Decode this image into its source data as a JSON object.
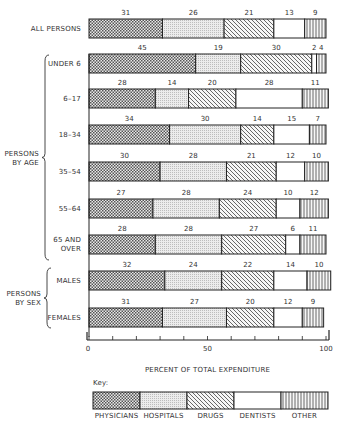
{
  "chart_data": {
    "type": "bar",
    "orientation": "horizontal",
    "stacked": true,
    "title": "",
    "xlabel": "PERCENT OF TOTAL EXPENDITURE",
    "ylabel": "",
    "xlim": [
      0,
      100
    ],
    "x_ticks": [
      0,
      10,
      20,
      30,
      40,
      50,
      60,
      70,
      80,
      90,
      100
    ],
    "x_tick_labels": [
      "0",
      "50",
      "100"
    ],
    "series_names": [
      "PHYSICIANS",
      "HOSPITALS",
      "DRUGS",
      "DENTISTS",
      "OTHER"
    ],
    "patterns": [
      "crosshatch",
      "stipple",
      "diagonal",
      "blank",
      "vertical"
    ],
    "rows": [
      {
        "label": "ALL PERSONS",
        "group": "",
        "values": [
          31,
          26,
          21,
          13,
          9
        ]
      },
      {
        "label": "UNDER 6",
        "group": "PERSONS BY AGE",
        "values": [
          45,
          19,
          30,
          2,
          4
        ]
      },
      {
        "label": "6–17",
        "group": "PERSONS BY AGE",
        "values": [
          28,
          14,
          20,
          28,
          11
        ]
      },
      {
        "label": "18–34",
        "group": "PERSONS BY AGE",
        "values": [
          34,
          30,
          14,
          15,
          7
        ]
      },
      {
        "label": "35–54",
        "group": "PERSONS BY AGE",
        "values": [
          30,
          28,
          21,
          12,
          10
        ]
      },
      {
        "label": "55–64",
        "group": "PERSONS BY AGE",
        "values": [
          27,
          28,
          24,
          10,
          12
        ]
      },
      {
        "label": "65 AND OVER",
        "group": "PERSONS BY AGE",
        "values": [
          28,
          28,
          27,
          6,
          11
        ]
      },
      {
        "label": "MALES",
        "group": "PERSONS BY SEX",
        "values": [
          32,
          24,
          22,
          14,
          10
        ]
      },
      {
        "label": "FEMALES",
        "group": "PERSONS BY SEX",
        "values": [
          31,
          27,
          20,
          12,
          9
        ]
      }
    ],
    "groups": [
      {
        "label_lines": [
          "PERSONS",
          "BY AGE"
        ]
      },
      {
        "label_lines": [
          "PERSONS",
          "BY SEX"
        ]
      }
    ],
    "legend": {
      "title": "Key:",
      "position": "bottom",
      "items": [
        "PHYSICIANS",
        "HOSPITALS",
        "DRUGS",
        "DENTISTS",
        "OTHER"
      ]
    },
    "grid": false
  }
}
